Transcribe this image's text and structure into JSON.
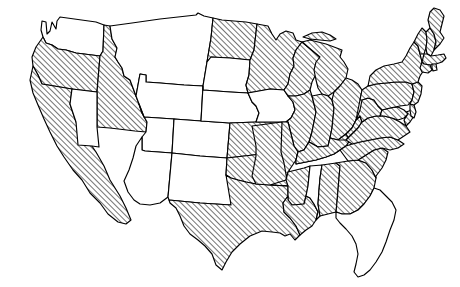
{
  "figure": {
    "name": "united-states-choropleth-map",
    "projection": "contiguous-united-states",
    "background_color": "#ffffff",
    "outline_color": "#000000",
    "hatch_color": "#000000",
    "hatch_angle_degrees": 45,
    "hatch_spacing_px": 4,
    "plain_fill_color": "#ffffff",
    "legend_present": false,
    "labels_present": false,
    "title_present": false
  },
  "chart_data": {
    "type": "map",
    "title": "",
    "subtitle": "",
    "xlabel": "",
    "ylabel": "",
    "legend": [
      {
        "key": "hatched",
        "label": "",
        "pattern": "diagonal-hatch-45",
        "value": 1
      },
      {
        "key": "plain",
        "label": "",
        "pattern": "solid-white",
        "value": 0
      }
    ],
    "categories": [
      "Washington",
      "Oregon",
      "California",
      "Idaho",
      "Nevada",
      "Montana",
      "Wyoming",
      "Utah",
      "Arizona",
      "Colorado",
      "New Mexico",
      "North Dakota",
      "South Dakota",
      "Nebraska",
      "Kansas",
      "Oklahoma",
      "Texas",
      "Minnesota",
      "Iowa",
      "Missouri",
      "Arkansas",
      "Louisiana",
      "Wisconsin",
      "Illinois",
      "Michigan",
      "Indiana",
      "Ohio",
      "Kentucky",
      "Tennessee",
      "Mississippi",
      "Alabama",
      "Georgia",
      "Florida",
      "South Carolina",
      "North Carolina",
      "Virginia",
      "West Virginia",
      "Maryland",
      "Delaware",
      "Pennsylvania",
      "New Jersey",
      "New York",
      "Connecticut",
      "Rhode Island",
      "Massachusetts",
      "Vermont",
      "New Hampshire",
      "Maine"
    ],
    "values": [
      0,
      1,
      1,
      1,
      0,
      0,
      0,
      0,
      0,
      0,
      0,
      1,
      0,
      0,
      1,
      1,
      1,
      1,
      0,
      1,
      1,
      1,
      1,
      1,
      1,
      1,
      1,
      1,
      1,
      0,
      1,
      1,
      0,
      1,
      1,
      1,
      1,
      1,
      1,
      1,
      1,
      1,
      1,
      1,
      1,
      1,
      1,
      1
    ],
    "counts": {
      "hatched": 35,
      "plain": 13,
      "total": 48
    }
  },
  "states": [
    {
      "id": "WA",
      "name": "Washington",
      "fill": "plain"
    },
    {
      "id": "OR",
      "name": "Oregon",
      "fill": "hatched"
    },
    {
      "id": "CA",
      "name": "California",
      "fill": "hatched"
    },
    {
      "id": "ID",
      "name": "Idaho",
      "fill": "hatched"
    },
    {
      "id": "NV",
      "name": "Nevada",
      "fill": "plain"
    },
    {
      "id": "MT",
      "name": "Montana",
      "fill": "plain"
    },
    {
      "id": "WY",
      "name": "Wyoming",
      "fill": "plain"
    },
    {
      "id": "UT",
      "name": "Utah",
      "fill": "plain"
    },
    {
      "id": "AZ",
      "name": "Arizona",
      "fill": "plain"
    },
    {
      "id": "CO",
      "name": "Colorado",
      "fill": "plain"
    },
    {
      "id": "NM",
      "name": "New Mexico",
      "fill": "plain"
    },
    {
      "id": "ND",
      "name": "North Dakota",
      "fill": "hatched"
    },
    {
      "id": "SD",
      "name": "South Dakota",
      "fill": "plain"
    },
    {
      "id": "NE",
      "name": "Nebraska",
      "fill": "plain"
    },
    {
      "id": "KS",
      "name": "Kansas",
      "fill": "hatched"
    },
    {
      "id": "OK",
      "name": "Oklahoma",
      "fill": "hatched"
    },
    {
      "id": "TX",
      "name": "Texas",
      "fill": "hatched"
    },
    {
      "id": "MN",
      "name": "Minnesota",
      "fill": "hatched"
    },
    {
      "id": "IA",
      "name": "Iowa",
      "fill": "plain"
    },
    {
      "id": "MO",
      "name": "Missouri",
      "fill": "hatched"
    },
    {
      "id": "AR",
      "name": "Arkansas",
      "fill": "hatched"
    },
    {
      "id": "LA",
      "name": "Louisiana",
      "fill": "hatched"
    },
    {
      "id": "WI",
      "name": "Wisconsin",
      "fill": "hatched"
    },
    {
      "id": "IL",
      "name": "Illinois",
      "fill": "hatched"
    },
    {
      "id": "MI",
      "name": "Michigan",
      "fill": "hatched"
    },
    {
      "id": "IN",
      "name": "Indiana",
      "fill": "hatched"
    },
    {
      "id": "OH",
      "name": "Ohio",
      "fill": "hatched"
    },
    {
      "id": "KY",
      "name": "Kentucky",
      "fill": "hatched"
    },
    {
      "id": "TN",
      "name": "Tennessee",
      "fill": "hatched"
    },
    {
      "id": "MS",
      "name": "Mississippi",
      "fill": "plain"
    },
    {
      "id": "AL",
      "name": "Alabama",
      "fill": "hatched"
    },
    {
      "id": "GA",
      "name": "Georgia",
      "fill": "hatched"
    },
    {
      "id": "FL",
      "name": "Florida",
      "fill": "plain"
    },
    {
      "id": "SC",
      "name": "South Carolina",
      "fill": "hatched"
    },
    {
      "id": "NC",
      "name": "North Carolina",
      "fill": "hatched"
    },
    {
      "id": "VA",
      "name": "Virginia",
      "fill": "hatched"
    },
    {
      "id": "WV",
      "name": "West Virginia",
      "fill": "hatched"
    },
    {
      "id": "MD",
      "name": "Maryland",
      "fill": "hatched"
    },
    {
      "id": "DE",
      "name": "Delaware",
      "fill": "hatched"
    },
    {
      "id": "PA",
      "name": "Pennsylvania",
      "fill": "hatched"
    },
    {
      "id": "NJ",
      "name": "New Jersey",
      "fill": "hatched"
    },
    {
      "id": "NY",
      "name": "New York",
      "fill": "hatched"
    },
    {
      "id": "CT",
      "name": "Connecticut",
      "fill": "hatched"
    },
    {
      "id": "RI",
      "name": "Rhode Island",
      "fill": "hatched"
    },
    {
      "id": "MA",
      "name": "Massachusetts",
      "fill": "hatched"
    },
    {
      "id": "VT",
      "name": "Vermont",
      "fill": "hatched"
    },
    {
      "id": "NH",
      "name": "New Hampshire",
      "fill": "hatched"
    },
    {
      "id": "ME",
      "name": "Maine",
      "fill": "hatched"
    }
  ]
}
